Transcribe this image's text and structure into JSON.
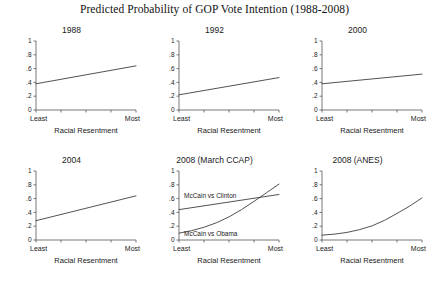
{
  "chart_data": {
    "type": "line",
    "title": "Predicted Probability of GOP Vote Intention (1988-2008)",
    "layout": {
      "rows": 2,
      "cols": 3,
      "shared_xlabel": "Racial Resentment",
      "x_tick_labels_ends": [
        "Least",
        "Most"
      ],
      "x_tick_count": 5,
      "y_tick_labels": [
        "1",
        ".8",
        ".6",
        ".4",
        ".2",
        "0"
      ],
      "y_tick_values": [
        1,
        0.8,
        0.6,
        0.4,
        0.2,
        0
      ],
      "ylim": [
        0,
        1
      ],
      "xlim": [
        0,
        1
      ],
      "grid": false,
      "legend": "inline-annotations"
    },
    "panels": [
      {
        "title": "1988",
        "xlabel": "Racial Resentment",
        "x_least_label": "Least",
        "x_most_label": "Most",
        "series": [
          {
            "name": "GOP vote intention 1988",
            "annotation": "",
            "x": [
              0,
              0.25,
              0.5,
              0.75,
              1
            ],
            "values": [
              0.38,
              0.445,
              0.51,
              0.575,
              0.64
            ]
          }
        ]
      },
      {
        "title": "1992",
        "xlabel": "Racial Resentment",
        "x_least_label": "Least",
        "x_most_label": "Most",
        "series": [
          {
            "name": "GOP vote intention 1992",
            "annotation": "",
            "x": [
              0,
              0.25,
              0.5,
              0.75,
              1
            ],
            "values": [
              0.22,
              0.2825,
              0.345,
              0.4075,
              0.47
            ]
          }
        ]
      },
      {
        "title": "2000",
        "xlabel": "Racial Resentment",
        "x_least_label": "Least",
        "x_most_label": "Most",
        "series": [
          {
            "name": "GOP vote intention 2000",
            "annotation": "",
            "x": [
              0,
              0.25,
              0.5,
              0.75,
              1
            ],
            "values": [
              0.38,
              0.415,
              0.45,
              0.485,
              0.52
            ]
          }
        ]
      },
      {
        "title": "2004",
        "xlabel": "Racial Resentment",
        "x_least_label": "Least",
        "x_most_label": "Most",
        "series": [
          {
            "name": "GOP vote intention 2004",
            "annotation": "",
            "x": [
              0,
              0.25,
              0.5,
              0.75,
              1
            ],
            "values": [
              0.28,
              0.37,
              0.46,
              0.55,
              0.64
            ]
          }
        ]
      },
      {
        "title": "2008 (March CCAP)",
        "xlabel": "Racial Resentment",
        "x_least_label": "Least",
        "x_most_label": "Most",
        "series": [
          {
            "name": "McCain vs Clinton",
            "annotation": "McCain vs Clinton",
            "x": [
              0,
              0.25,
              0.5,
              0.75,
              1
            ],
            "values": [
              0.44,
              0.495,
              0.55,
              0.605,
              0.66
            ]
          },
          {
            "name": "McCain vs Obama",
            "annotation": "McCain vs Obama",
            "x": [
              0,
              0.125,
              0.25,
              0.375,
              0.5,
              0.625,
              0.75,
              0.875,
              1
            ],
            "values": [
              0.1,
              0.135,
              0.185,
              0.25,
              0.335,
              0.44,
              0.56,
              0.685,
              0.81
            ]
          }
        ]
      },
      {
        "title": "2008 (ANES)",
        "xlabel": "Racial Resentment",
        "x_least_label": "Least",
        "x_most_label": "Most",
        "series": [
          {
            "name": "GOP vote intention 2008 ANES",
            "annotation": "",
            "x": [
              0,
              0.125,
              0.25,
              0.375,
              0.5,
              0.625,
              0.75,
              0.875,
              1
            ],
            "values": [
              0.07,
              0.085,
              0.11,
              0.15,
              0.205,
              0.285,
              0.385,
              0.49,
              0.61
            ]
          }
        ]
      }
    ]
  },
  "colors": {
    "background": "#ffffff",
    "line": "#333333",
    "axis": "#555555",
    "text": "#1a1a1a"
  }
}
